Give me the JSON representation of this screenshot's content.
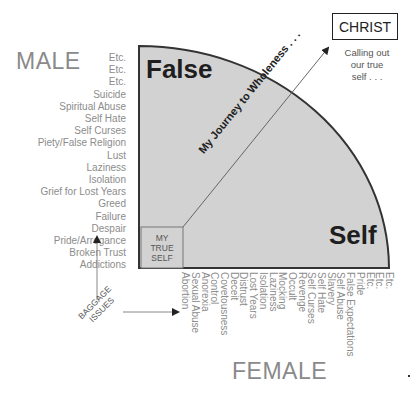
{
  "titles": {
    "male": "MALE",
    "female": "FEMALE"
  },
  "quadrant": {
    "top_label": "False",
    "bottom_label": "Self",
    "fill_color": "#d2d2d2",
    "stroke_color": "#333333"
  },
  "true_self_box": {
    "lines": [
      "MY",
      "TRUE",
      "SELF"
    ]
  },
  "journey_label": "My Journey to Wholeness . . .",
  "christ": {
    "box_label": "CHRIST",
    "subtitle_lines": [
      "Calling out",
      "our true",
      "self . . ."
    ]
  },
  "baggage": {
    "lines": [
      "BAGGAGE",
      "ISSUES"
    ]
  },
  "male_issues": [
    "Etc.",
    "Etc.",
    "Etc.",
    "Suicide",
    "Spiritual Abuse",
    "Self Hate",
    "Self Curses",
    "Piety/False Religion",
    "Lust",
    "Laziness",
    "Isolation",
    "Grief for Lost Years",
    "Greed",
    "Failure",
    "Despair",
    "Pride/Arrogance",
    "Broken Trust",
    "Addictions"
  ],
  "female_issues": [
    "Etc.",
    "Etc.",
    "Etc.",
    "Pride",
    "False Expectations",
    "Self Abuse",
    "Slavery",
    "Self Hate",
    "Self Curses",
    "Revenge",
    "Occult",
    "Mocking",
    "Laziness",
    "Isolation",
    "Lost Years",
    "Distrust",
    "Deceit",
    "Covetousness",
    "Control",
    "Anorexia",
    "Sexual Abuse",
    "Abortion"
  ]
}
